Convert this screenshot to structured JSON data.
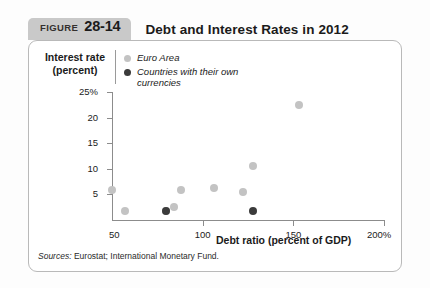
{
  "figure": {
    "tag_word": "FIGURE",
    "tag_number": "28-14",
    "title": "Debt and Interest Rates in 2012",
    "sources_lead": "Sources:",
    "sources_text": " Eurostat; International Monetary Fund."
  },
  "legend": {
    "items": [
      {
        "label": "Euro Area",
        "color": "#c3c3c3",
        "icon": "circle-marker-icon"
      },
      {
        "label": "Countries with their own currencies",
        "color": "#3b3b3b",
        "icon": "circle-marker-icon"
      }
    ]
  },
  "colors": {
    "euro_area": "#c3c3c3",
    "own_currency": "#3b3b3b",
    "axis": "#8c8c8c",
    "panel_border": "#b9b9b9",
    "tag_background": "#c9c9c9"
  },
  "chart_data": {
    "type": "scatter",
    "title": "Debt and Interest Rates in 2012",
    "xlabel": "Debt ratio (percent of GDP)",
    "ylabel": "Interest rate (percent)",
    "xlim": [
      50,
      200
    ],
    "ylim": [
      0,
      25
    ],
    "xticks": [
      50,
      100,
      150,
      200
    ],
    "xticklabels": [
      "50",
      "100",
      "150",
      "200%"
    ],
    "yticks": [
      5,
      10,
      15,
      20,
      25
    ],
    "yticklabels": [
      "5",
      "10",
      "15",
      "20",
      "25%"
    ],
    "grid": false,
    "legend_position": "top-left",
    "series": [
      {
        "name": "Euro Area",
        "color": "#c3c3c3",
        "points": [
          {
            "x": 50,
            "y": 5.8
          },
          {
            "x": 57,
            "y": 1.8
          },
          {
            "x": 80,
            "y": 1.7
          },
          {
            "x": 84,
            "y": 2.6
          },
          {
            "x": 88,
            "y": 5.8
          },
          {
            "x": 106,
            "y": 6.2
          },
          {
            "x": 122,
            "y": 5.4
          },
          {
            "x": 128,
            "y": 10.5
          },
          {
            "x": 153,
            "y": 22.5
          }
        ]
      },
      {
        "name": "Countries with their own currencies",
        "color": "#3b3b3b",
        "points": [
          {
            "x": 80,
            "y": 1.8
          },
          {
            "x": 128,
            "y": 1.7
          }
        ]
      }
    ]
  }
}
